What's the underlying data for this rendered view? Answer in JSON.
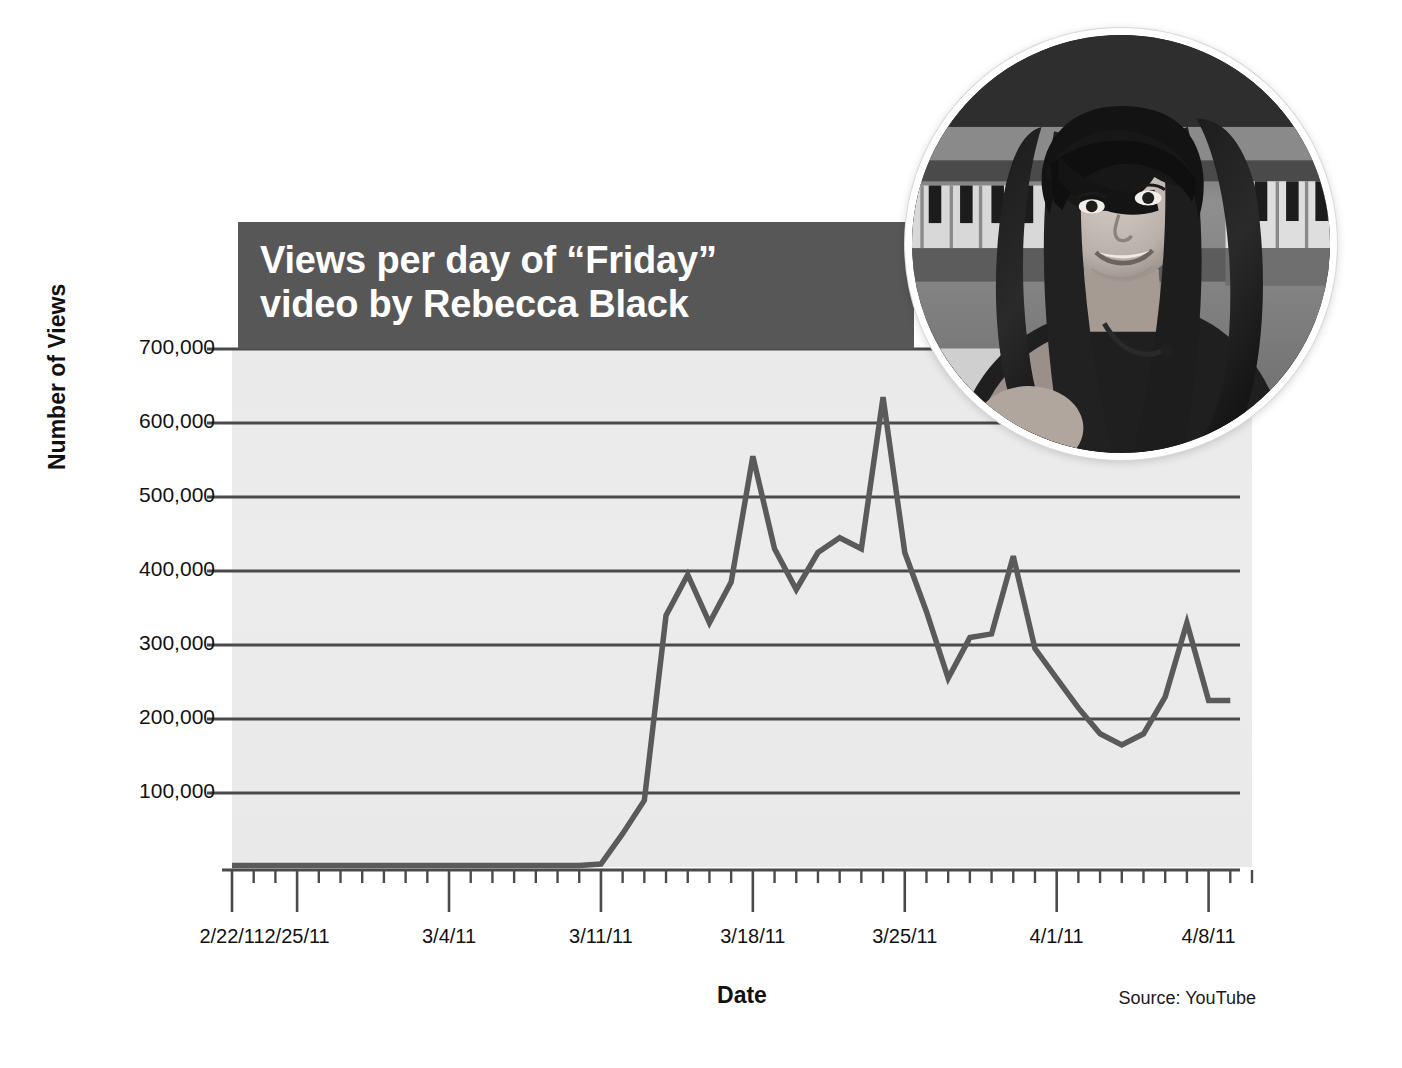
{
  "title": {
    "line1": "Views per day of “Friday”",
    "line2": "video by Rebecca Black"
  },
  "source_note": "Source: YouTube",
  "portrait": {
    "alt": "Rebecca Black seated at a piano, black and white circular photo"
  },
  "colors": {
    "banner": "#575757",
    "plot_background": "#ebebeb",
    "gridline": "#4a4a4a",
    "data_line": "#5a5a5a",
    "axis": "#4a4a4a",
    "text": "#111111",
    "banner_text": "#ffffff"
  },
  "chart_data": {
    "type": "line",
    "title": "Views per day of “Friday” video by Rebecca Black",
    "xlabel": "Date",
    "ylabel": "Number of Views",
    "ylim": [
      0,
      740000
    ],
    "ytick_values": [
      100000,
      200000,
      300000,
      400000,
      500000,
      600000,
      700000
    ],
    "ytick_labels": [
      "100,000",
      "200,000",
      "300,000",
      "400,000",
      "500,000",
      "600,000",
      "700,000"
    ],
    "xtick_labels": [
      "2/22/11",
      "2/25/11",
      "3/4/11",
      "3/11/11",
      "3/18/11",
      "3/25/11",
      "4/1/11",
      "4/8/11"
    ],
    "xtick_days": [
      0,
      3,
      10,
      17,
      24,
      31,
      38,
      45
    ],
    "xlim_days": [
      0,
      47
    ],
    "minor_tick_interval_days": 1,
    "grid": "horizontal",
    "legend": "none",
    "series": [
      {
        "name": "Views per day",
        "x_days": [
          0,
          1,
          2,
          3,
          4,
          5,
          6,
          7,
          8,
          9,
          10,
          11,
          12,
          13,
          14,
          15,
          16,
          17,
          18,
          19,
          20,
          21,
          22,
          23,
          24,
          25,
          26,
          27,
          28,
          29,
          30,
          31,
          32,
          33,
          34,
          35,
          36,
          37,
          38,
          39,
          40,
          41,
          42,
          43,
          44,
          45,
          46
        ],
        "values": [
          2000,
          2000,
          2000,
          2000,
          2000,
          2000,
          2000,
          2000,
          2000,
          2000,
          2000,
          2000,
          2000,
          2000,
          2000,
          2000,
          2000,
          4000,
          45000,
          90000,
          340000,
          395000,
          330000,
          385000,
          555000,
          430000,
          375000,
          425000,
          445000,
          430000,
          635000,
          425000,
          345000,
          255000,
          310000,
          315000,
          420000,
          295000,
          255000,
          215000,
          180000,
          165000,
          180000,
          230000,
          330000,
          225000,
          225000
        ]
      }
    ]
  }
}
